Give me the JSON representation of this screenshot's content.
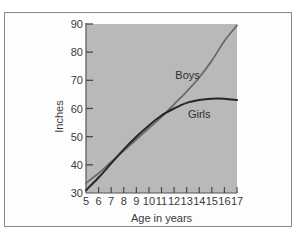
{
  "chart_data": {
    "type": "line",
    "title": "",
    "xlabel": "Age in years",
    "ylabel": "Inches",
    "xlim": [
      5,
      17
    ],
    "ylim": [
      30,
      90
    ],
    "grid": false,
    "x": [
      5,
      6,
      7,
      8,
      9,
      10,
      11,
      12,
      13,
      14,
      15,
      16,
      17
    ],
    "x_ticks": [
      "5",
      "6",
      "7",
      "8",
      "9",
      "10",
      "11",
      "12",
      "13",
      "14",
      "15",
      "16",
      "17"
    ],
    "y_ticks": [
      "30",
      "40",
      "50",
      "60",
      "70",
      "80",
      "90"
    ],
    "y_tick_values": [
      30,
      40,
      50,
      60,
      70,
      80,
      90
    ],
    "x_tick_values": [
      5,
      6,
      7,
      8,
      9,
      10,
      11,
      12,
      13,
      14,
      15,
      16,
      17
    ],
    "series": [
      {
        "name": "Boys",
        "color": "#6a6a6a",
        "values": [
          33.5,
          37,
          41,
          45,
          49,
          53,
          57,
          61.5,
          66,
          71,
          77,
          84,
          89.5
        ],
        "label_position": "upper-middle"
      },
      {
        "name": "Girls",
        "color": "#262626",
        "values": [
          31,
          35.5,
          40.5,
          45.5,
          50,
          54,
          57.5,
          60,
          62,
          63,
          63.5,
          63.5,
          63
        ],
        "label_position": "below-curve"
      }
    ],
    "legend": "inline labels",
    "background_color": "#b9b9b9"
  }
}
